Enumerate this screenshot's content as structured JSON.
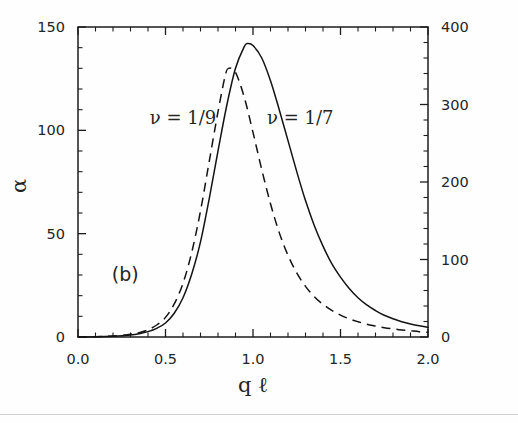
{
  "figure": {
    "panel_label": "(b)",
    "background": "#fefefe",
    "ink_color": "#131313"
  },
  "chart_data": {
    "type": "line",
    "title": "",
    "subtitle": "",
    "panel": "(b)",
    "xlabel": "q ℓ",
    "ylabel": "α",
    "xlim": [
      0.0,
      2.0
    ],
    "ylim": [
      0,
      150
    ],
    "ylim_right": [
      0,
      400
    ],
    "grid": false,
    "legend": "inline-annotations",
    "xticks": [
      0.0,
      0.5,
      1.0,
      1.5,
      2.0
    ],
    "xticklabels": [
      "0.0",
      "0.5",
      "1.0",
      "1.5",
      "2.0"
    ],
    "x_minor_step": 0.1,
    "yticks": [
      0,
      50,
      100,
      150
    ],
    "yticklabels": [
      "0",
      "50",
      "100",
      "150"
    ],
    "y_minor_step": 10,
    "yticks_right": [
      0,
      100,
      200,
      300,
      400
    ],
    "yticklabels_right": [
      "0",
      "100",
      "200",
      "300",
      "400"
    ],
    "y_right_minor_step": 20,
    "annotations": [
      {
        "text": "ν = 1/9",
        "x": 0.6,
        "y": 103,
        "name": "nu-1-9-label"
      },
      {
        "text": "ν = 1/7",
        "x": 1.27,
        "y": 103,
        "name": "nu-1-7-label"
      },
      {
        "text": "(b)",
        "x": 0.27,
        "y": 27,
        "name": "panel-b-label"
      }
    ],
    "series": [
      {
        "name": "ν = 1/7",
        "style": "solid",
        "peak_x": 0.97,
        "peak_y": 142,
        "x": [
          0.0,
          0.1,
          0.2,
          0.3,
          0.35,
          0.4,
          0.45,
          0.5,
          0.55,
          0.6,
          0.65,
          0.7,
          0.75,
          0.8,
          0.85,
          0.9,
          0.95,
          0.97,
          1.0,
          1.05,
          1.1,
          1.15,
          1.2,
          1.25,
          1.3,
          1.35,
          1.4,
          1.45,
          1.5,
          1.55,
          1.6,
          1.65,
          1.7,
          1.75,
          1.8,
          1.85,
          1.9,
          1.95,
          2.0
        ],
        "y": [
          0.0,
          0.1,
          0.4,
          1.0,
          1.6,
          2.6,
          4.2,
          6.8,
          11.5,
          19.0,
          30.5,
          46.0,
          67.0,
          90.0,
          112.0,
          130.0,
          140.5,
          142.0,
          141.0,
          135.0,
          124.0,
          110.0,
          95.0,
          80.0,
          66.0,
          54.0,
          44.0,
          35.5,
          29.0,
          23.5,
          19.0,
          15.5,
          12.8,
          10.5,
          8.8,
          7.4,
          6.3,
          5.4,
          4.7
        ]
      },
      {
        "name": "ν = 1/9",
        "style": "dashed",
        "peak_x": 0.86,
        "peak_y": 130,
        "x": [
          0.0,
          0.1,
          0.2,
          0.3,
          0.35,
          0.4,
          0.45,
          0.5,
          0.55,
          0.6,
          0.65,
          0.7,
          0.75,
          0.8,
          0.84,
          0.86,
          0.9,
          0.95,
          1.0,
          1.05,
          1.1,
          1.15,
          1.2,
          1.25,
          1.3,
          1.35,
          1.4,
          1.45,
          1.5,
          1.55,
          1.6,
          1.65,
          1.7,
          1.75,
          1.8,
          1.85,
          1.9,
          1.95,
          2.0
        ],
        "y": [
          0.0,
          0.1,
          0.5,
          1.3,
          2.1,
          3.5,
          5.8,
          9.5,
          16.0,
          26.0,
          41.0,
          61.0,
          85.0,
          109.0,
          126.0,
          130.0,
          128.0,
          116.0,
          99.0,
          81.0,
          64.5,
          50.5,
          39.5,
          31.0,
          24.5,
          19.5,
          15.8,
          12.9,
          10.6,
          8.8,
          7.4,
          6.2,
          5.3,
          4.5,
          3.9,
          3.4,
          3.0,
          2.6,
          2.3
        ]
      }
    ]
  }
}
